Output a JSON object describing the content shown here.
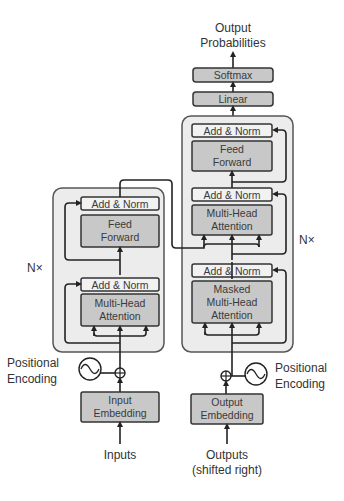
{
  "diagram": {
    "title_top": [
      "Output",
      "Probabilities"
    ],
    "head": {
      "softmax": "Softmax",
      "linear": "Linear"
    },
    "encoder": {
      "repeat_label": "N×",
      "add_norm_top": "Add & Norm",
      "feed_forward": [
        "Feed",
        "Forward"
      ],
      "add_norm_bottom": "Add & Norm",
      "attention": [
        "Multi-Head",
        "Attention"
      ],
      "positional_encoding": [
        "Positional",
        "Encoding"
      ],
      "embedding": [
        "Input",
        "Embedding"
      ],
      "input_label": "Inputs"
    },
    "decoder": {
      "repeat_label": "N×",
      "add_norm_top": "Add & Norm",
      "feed_forward": [
        "Feed",
        "Forward"
      ],
      "add_norm_mid": "Add & Norm",
      "cross_attention": [
        "Multi-Head",
        "Attention"
      ],
      "add_norm_bottom": "Add & Norm",
      "masked_attention": [
        "Masked",
        "Multi-Head",
        "Attention"
      ],
      "positional_encoding": [
        "Positional",
        "Encoding"
      ],
      "embedding": [
        "Output",
        "Embedding"
      ],
      "input_label": [
        "Outputs",
        "(shifted right)"
      ]
    },
    "colors": {
      "stack_bg": "#ececec",
      "sublayer_fill": "#c8c8c8",
      "norm_fill": "#f2f2f2",
      "stroke": "#333333"
    }
  }
}
